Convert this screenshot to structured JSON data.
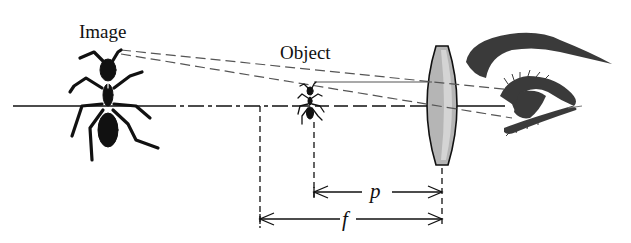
{
  "diagram": {
    "type": "simple-magnifier-optics",
    "labels": {
      "image": "Image",
      "object": "Object",
      "p": "p",
      "f": "f"
    },
    "elements": [
      {
        "id": "image-ant",
        "role": "virtual enlarged image"
      },
      {
        "id": "object-ant",
        "role": "real object inside focal length"
      },
      {
        "id": "converging-lens",
        "role": "magnifying lens"
      },
      {
        "id": "eye",
        "role": "observer"
      }
    ],
    "dimensions": [
      {
        "symbol": "p",
        "meaning": "object distance from lens"
      },
      {
        "symbol": "f",
        "meaning": "focal length"
      }
    ],
    "colors": {
      "ink": "#111111",
      "lens_fill": "#b5b5b5",
      "lens_highlight": "#d4d4d4",
      "eye": "#3a3a3a",
      "background": "#ffffff"
    }
  }
}
